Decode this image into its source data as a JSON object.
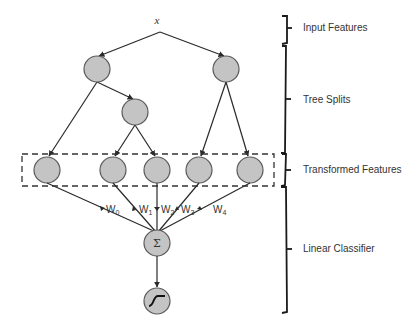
{
  "diagram": {
    "input_label": "x",
    "layers": [
      {
        "label": "Input Features"
      },
      {
        "label": "Tree Splits"
      },
      {
        "label": "Transformed Features"
      },
      {
        "label": "Linear Classifier"
      }
    ],
    "weights": [
      {
        "w": "W",
        "sub": "0"
      },
      {
        "w": "W",
        "sub": "1"
      },
      {
        "w": "W",
        "sub": "2"
      },
      {
        "w": "W",
        "sub": "3"
      },
      {
        "w": "W",
        "sub": "4"
      }
    ],
    "sum_symbol": "Σ",
    "colors": {
      "node_fill": "#c4c4c4",
      "node_stroke": "#5a5a5a",
      "line": "#2a2a2a"
    }
  }
}
